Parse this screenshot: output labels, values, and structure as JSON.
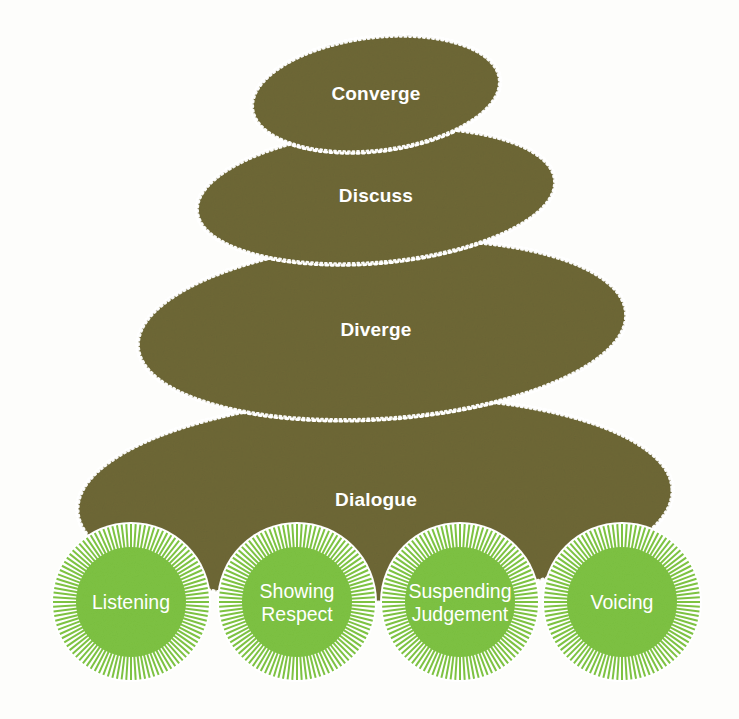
{
  "diagram": {
    "type": "stacked-ellipse-pyramid",
    "colors": {
      "stone": "#6e6836",
      "stone_edge": "#ffffff",
      "circle_fill": "#7dc242",
      "circle_rays": "#7dc242",
      "label_text": "#ffffff",
      "background": "#fdfdfb"
    },
    "stages": [
      {
        "id": "converge",
        "label": "Converge",
        "order": 1,
        "cx": 376,
        "cy": 94,
        "rx": 124,
        "ry": 56,
        "rotate": -7
      },
      {
        "id": "discuss",
        "label": "Discuss",
        "order": 2,
        "cx": 376,
        "cy": 196,
        "rx": 179,
        "ry": 66,
        "rotate": -5
      },
      {
        "id": "diverge",
        "label": "Diverge",
        "order": 3,
        "cx": 382,
        "cy": 330,
        "rx": 244,
        "ry": 88,
        "rotate": -4
      },
      {
        "id": "dialogue",
        "label": "Dialogue",
        "order": 4,
        "cx": 375,
        "cy": 500,
        "rx": 297,
        "ry": 102,
        "rotate": -2
      }
    ],
    "foundations": [
      {
        "id": "listening",
        "lines": [
          "Listening"
        ],
        "cx": 131,
        "cy": 602,
        "r_inner": 55,
        "r_outer": 78
      },
      {
        "id": "showing-respect",
        "lines": [
          "Showing",
          "Respect"
        ],
        "cx": 297,
        "cy": 602,
        "r_inner": 55,
        "r_outer": 78
      },
      {
        "id": "suspending-judgement",
        "lines": [
          "Suspending",
          "Judgement"
        ],
        "cx": 460,
        "cy": 602,
        "r_inner": 55,
        "r_outer": 78
      },
      {
        "id": "voicing",
        "lines": [
          "Voicing"
        ],
        "cx": 622,
        "cy": 602,
        "r_inner": 55,
        "r_outer": 78
      }
    ]
  }
}
